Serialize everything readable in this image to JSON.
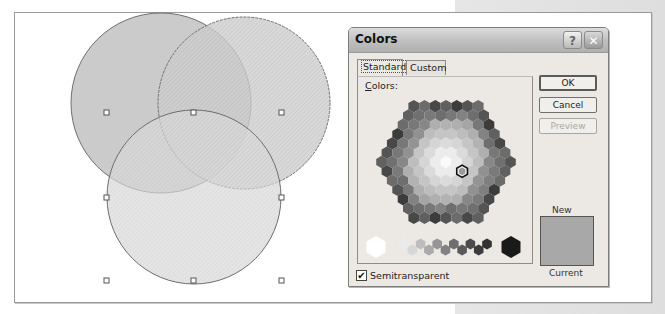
{
  "canvas": {
    "venn": {
      "circles": [
        {
          "name": "top-left",
          "fill": "#c9c9c9",
          "pattern": "solid"
        },
        {
          "name": "top-right",
          "fill": "#bdbdbd",
          "pattern": "hatched"
        },
        {
          "name": "bottom",
          "fill": "#d4d4d4",
          "pattern": "hatched"
        }
      ],
      "selection_handles": 8
    }
  },
  "dialog": {
    "title": "Colors",
    "help_button": "?",
    "close_button": "✕",
    "tabs": [
      {
        "label": "Standard",
        "active": true
      },
      {
        "label": "Custom",
        "active": false
      }
    ],
    "colors_label_accel": "C",
    "colors_label_rest": "olors:",
    "buttons": {
      "ok": "OK",
      "cancel": "Cancel",
      "preview": "Preview"
    },
    "preview_enabled": false,
    "new_label": "New",
    "current_label": "Current",
    "new_color": "#a8a8a8",
    "semitransparent": {
      "checked": true,
      "check_glyph": "✔",
      "label": "Semitransparent"
    },
    "selected_color": "#9a9a9a"
  }
}
